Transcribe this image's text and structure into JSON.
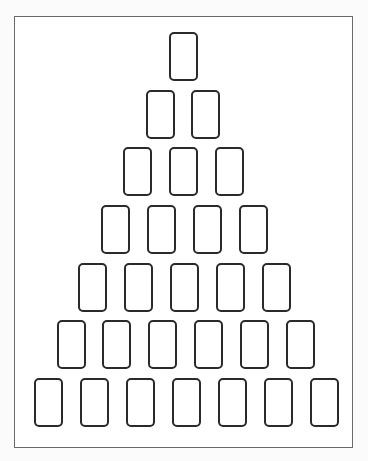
{
  "diagram": {
    "type": "card-spread-layout",
    "shape": "pyramid",
    "total_positions": 28,
    "colors": {
      "frame_border": "#6a6a6a",
      "card_border": "#2a2a2a",
      "background": "#ffffff"
    },
    "frame": {
      "x": 14,
      "y": 16,
      "width": 339,
      "height": 432
    },
    "card_size": {
      "width": 29,
      "height": 49
    },
    "rows": [
      {
        "row": 1,
        "count": 1,
        "y": 32,
        "x": [
          169
        ]
      },
      {
        "row": 2,
        "count": 2,
        "y": 90,
        "x": [
          146,
          191
        ]
      },
      {
        "row": 3,
        "count": 3,
        "y": 147,
        "x": [
          123,
          169,
          215
        ]
      },
      {
        "row": 4,
        "count": 4,
        "y": 205,
        "x": [
          101,
          147,
          193,
          239
        ]
      },
      {
        "row": 5,
        "count": 5,
        "y": 263,
        "x": [
          78,
          124,
          170,
          216,
          262
        ]
      },
      {
        "row": 6,
        "count": 6,
        "y": 320,
        "x": [
          57,
          102,
          148,
          194,
          240,
          286
        ]
      },
      {
        "row": 7,
        "count": 7,
        "y": 378,
        "x": [
          34,
          80,
          126,
          172,
          218,
          264,
          310
        ]
      }
    ]
  }
}
